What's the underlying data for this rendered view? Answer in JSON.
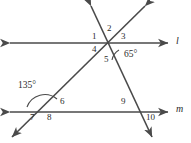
{
  "figure": {
    "stroke_color": "#4a4a4a",
    "text_color": "#2b2b2b",
    "background": "#ffffff"
  },
  "lines": [
    {
      "name": "line-l",
      "label": "l",
      "label_x": 176,
      "label_y": 37,
      "orientation": "horizontal",
      "y": 43,
      "x1": 8,
      "x2": 170,
      "arrows": "both"
    },
    {
      "name": "line-m",
      "label": "m",
      "label_x": 178,
      "label_y": 105,
      "orientation": "horizontal",
      "y": 112,
      "x1": 8,
      "x2": 170,
      "arrows": "both"
    },
    {
      "name": "transversal-steep",
      "label": "",
      "x1": 90,
      "y1": 4,
      "x2": 153,
      "y2": 139,
      "arrows": "both"
    },
    {
      "name": "transversal-shallow",
      "label": "",
      "x1": 146,
      "y1": 4,
      "x2": 11,
      "y2": 139,
      "arrows": "both"
    }
  ],
  "intersections": [
    {
      "name": "top-vertex",
      "x": 106,
      "y": 43
    },
    {
      "name": "bottom-left-vertex",
      "x": 46,
      "y": 112
    },
    {
      "name": "bottom-right-vertex",
      "x": 140,
      "y": 112
    }
  ],
  "angle_numbers": [
    {
      "id": "1",
      "text": "1",
      "x": 92,
      "y": 33
    },
    {
      "id": "2",
      "text": "2",
      "x": 107,
      "y": 25
    },
    {
      "id": "3",
      "text": "3",
      "x": 122,
      "y": 33
    },
    {
      "id": "4",
      "text": "4",
      "x": 92,
      "y": 46
    },
    {
      "id": "5",
      "text": "5",
      "x": 105,
      "y": 55
    },
    {
      "id": "6",
      "text": "6",
      "x": 60,
      "y": 98
    },
    {
      "id": "7",
      "text": "7",
      "x": 30,
      "y": 114
    },
    {
      "id": "8",
      "text": "8",
      "x": 48,
      "y": 114
    },
    {
      "id": "9",
      "text": "9",
      "x": 121,
      "y": 98
    },
    {
      "id": "10",
      "text": "10",
      "x": 147,
      "y": 114
    }
  ],
  "angle_measures": [
    {
      "id": "angle-65",
      "text": "65°",
      "x": 124,
      "y": 51,
      "vertex": "top-vertex"
    },
    {
      "id": "angle-135",
      "text": "135°",
      "x": 19,
      "y": 82,
      "vertex": "bottom-left-vertex"
    }
  ],
  "arcs": [
    {
      "name": "arc-65",
      "d": "M 118 50 A 14 14 0 0 0 113 59"
    },
    {
      "name": "arc-135",
      "d": "M 28 105 A 18 18 0 0 1 59 99"
    }
  ]
}
